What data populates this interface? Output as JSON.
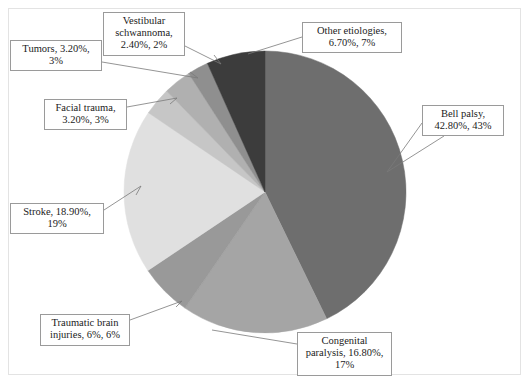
{
  "figure": {
    "frame_border_color": "#e3e3e3",
    "background": "#ffffff",
    "label_border_color": "#9a9a9a",
    "leader_line_color": "#7a7a7a"
  },
  "chart_data": {
    "type": "pie",
    "title": "",
    "subtitle": "",
    "xlabel": "",
    "ylabel": "",
    "grid": false,
    "legend_position": "none",
    "label_format": "category, value%, percent%",
    "start_angle_deg": 0,
    "direction": "clockwise",
    "center_px": [
      265,
      192
    ],
    "radius_px": 141,
    "total_value_pct": 100,
    "categories": [
      "Bell palsy",
      "Congenital paralysis",
      "Traumatic brain injuries",
      "Stroke",
      "Facial trauma",
      "Tumors",
      "Vestibular schwannoma",
      "Other etiologies"
    ],
    "values": [
      42.8,
      16.8,
      6,
      18.9,
      3.2,
      3.2,
      2.4,
      6.7
    ],
    "percents": [
      43,
      17,
      6,
      19,
      3,
      3,
      2,
      7
    ],
    "colors": [
      "#6e6e6e",
      "#a5a5a5",
      "#999999",
      "#e0e0e0",
      "#c6c6c6",
      "#b0b0b0",
      "#8f8f8f",
      "#3c3c3c"
    ],
    "slices": [
      {
        "name": "Bell palsy",
        "value": 42.8,
        "value_text": "42.80%",
        "percent": 43,
        "percent_text": "43%",
        "label": "Bell palsy,\n42.80%, 43%",
        "color": "#6e6e6e"
      },
      {
        "name": "Congenital paralysis",
        "value": 16.8,
        "value_text": "16.80%",
        "percent": 17,
        "percent_text": "17%",
        "label": "Congenital\nparalysis, 16.80%,\n17%",
        "color": "#a5a5a5"
      },
      {
        "name": "Traumatic brain injuries",
        "value": 6,
        "value_text": "6%",
        "percent": 6,
        "percent_text": "6%",
        "label": "Traumatic brain\ninjuries, 6%, 6%",
        "color": "#999999"
      },
      {
        "name": "Stroke",
        "value": 18.9,
        "value_text": "18.90%",
        "percent": 19,
        "percent_text": "19%",
        "label": "Stroke, 18.90%,\n19%",
        "color": "#e0e0e0"
      },
      {
        "name": "Facial trauma",
        "value": 3.2,
        "value_text": "3.20%",
        "percent": 3,
        "percent_text": "3%",
        "label": "Facial trauma,\n3.20%, 3%",
        "color": "#c6c6c6"
      },
      {
        "name": "Tumors",
        "value": 3.2,
        "value_text": "3.20%",
        "percent": 3,
        "percent_text": "3%",
        "label": "Tumors, 3.20%,\n3%",
        "color": "#b0b0b0"
      },
      {
        "name": "Vestibular schwannoma",
        "value": 2.4,
        "value_text": "2.40%",
        "percent": 2,
        "percent_text": "2%",
        "label": "Vestibular\nschwannoma,\n2.40%, 2%",
        "color": "#8f8f8f"
      },
      {
        "name": "Other etiologies",
        "value": 6.7,
        "value_text": "6.70%",
        "percent": 7,
        "percent_text": "7%",
        "label": "Other etiologies,\n6.70%, 7%",
        "color": "#3c3c3c"
      }
    ]
  },
  "callouts": [
    {
      "key": "vestibular-schwannoma",
      "label": "Vestibular\nschwannoma,\n2.40%, 2%",
      "x": 103,
      "y": 12,
      "w": 82,
      "h": 42
    },
    {
      "key": "other-etiologies",
      "label": "Other etiologies,\n6.70%, 7%",
      "x": 302,
      "y": 22,
      "w": 100,
      "h": 30
    },
    {
      "key": "tumors",
      "label": "Tumors, 3.20%,\n3%",
      "x": 10,
      "y": 40,
      "w": 92,
      "h": 30
    },
    {
      "key": "bell-palsy",
      "label": "Bell palsy,\n42.80%, 43%",
      "x": 422,
      "y": 105,
      "w": 82,
      "h": 31
    },
    {
      "key": "facial-trauma",
      "label": "Facial trauma,\n3.20%, 3%",
      "x": 44,
      "y": 99,
      "w": 83,
      "h": 31
    },
    {
      "key": "stroke",
      "label": "Stroke, 18.90%,\n19%",
      "x": 10,
      "y": 203,
      "w": 94,
      "h": 31
    },
    {
      "key": "traumatic-brain-injuries",
      "label": "Traumatic brain\ninjuries, 6%, 6%",
      "x": 40,
      "y": 314,
      "w": 90,
      "h": 32
    },
    {
      "key": "congenital-paralysis",
      "label": "Congenital\nparalysis, 16.80%,\n17%",
      "x": 297,
      "y": 332,
      "w": 95,
      "h": 44
    }
  ],
  "leaders": [
    {
      "key": "leader-vestibular-schwannoma",
      "points": "185,46 221,64 214,55"
    },
    {
      "key": "leader-other-etiologies",
      "points": "302,37 248,54"
    },
    {
      "key": "leader-tumors",
      "points": "102,62 198,78 190,72"
    },
    {
      "key": "leader-bell-palsy",
      "points": "422,123 387,172"
    },
    {
      "key": "leader-bell-palsy-2",
      "points": "444,136 387,172"
    },
    {
      "key": "leader-facial-trauma",
      "points": "127,107 177,98 170,104"
    },
    {
      "key": "leader-stroke",
      "points": "104,210 141,186 136,195"
    },
    {
      "key": "leader-traumatic-brain-injuries",
      "points": "130,320 182,301 176,307"
    },
    {
      "key": "leader-congenital-paralysis",
      "points": "297,344 212,330"
    }
  ]
}
